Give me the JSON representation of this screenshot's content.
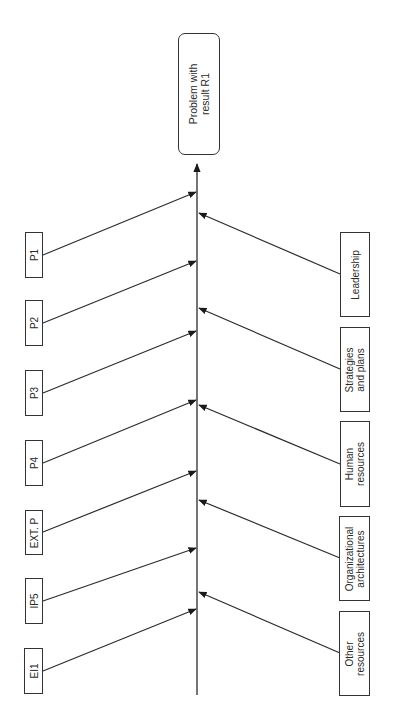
{
  "diagram": {
    "type": "fishbone",
    "orientation": "rotated -90deg (effect at top)",
    "effect": {
      "line1": "Problem with",
      "line2": "result R1"
    },
    "left_causes": [
      {
        "id": "p1",
        "label": "P1"
      },
      {
        "id": "p2",
        "label": "P2"
      },
      {
        "id": "p3",
        "label": "P3"
      },
      {
        "id": "p4",
        "label": "P4"
      },
      {
        "id": "ext-p",
        "label": "EXT. P"
      },
      {
        "id": "ip5",
        "label": "IP5"
      },
      {
        "id": "ei1",
        "label": "EI1"
      }
    ],
    "right_causes": [
      {
        "id": "leadership",
        "line1": "Leadership",
        "line2": ""
      },
      {
        "id": "strategies",
        "line1": "Strategies",
        "line2": "and plans"
      },
      {
        "id": "human-resources",
        "line1": "Human",
        "line2": "resources"
      },
      {
        "id": "org-architectures",
        "line1": "Organizational",
        "line2": "architectures"
      },
      {
        "id": "other-resources",
        "line1": "Other",
        "line2": "resources"
      }
    ],
    "colors": {
      "line": "#2b2b2b",
      "box_border": "#333333",
      "background": "#ffffff"
    }
  }
}
